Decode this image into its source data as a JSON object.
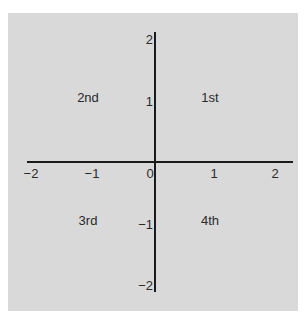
{
  "diagram": {
    "title": "",
    "axes": {
      "x": {
        "range": [
          -2,
          2
        ],
        "ticks": [
          -2,
          -1,
          0,
          1,
          2
        ],
        "tick_labels": [
          "−2",
          "−1",
          "0",
          "1",
          "2"
        ]
      },
      "y": {
        "range": [
          -2,
          2
        ],
        "ticks": [
          2,
          1,
          -1,
          -2
        ],
        "tick_labels": [
          "2",
          "1",
          "−1",
          "−2"
        ]
      }
    },
    "quadrants": [
      {
        "label": "1st",
        "x": 1,
        "y": 1
      },
      {
        "label": "2nd",
        "x": -1,
        "y": 1
      },
      {
        "label": "3rd",
        "x": -1,
        "y": -1
      },
      {
        "label": "4th",
        "x": 1,
        "y": -1
      }
    ],
    "colors": {
      "background": "#d9d9d9",
      "axis": "#1a1a1a",
      "text": "#2a2a2a"
    }
  }
}
